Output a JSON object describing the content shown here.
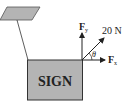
{
  "diagram": {
    "sign_label": "SIGN",
    "force_label": "20 N",
    "fy_label": "F",
    "fy_sub": "y",
    "fx_label": "F",
    "fx_sub": "x",
    "angle_label": "θ",
    "colors": {
      "sign_fill": "#b4b4b4",
      "mount_fill": "#b4b4b4",
      "stroke": "#333333",
      "background": "#ffffff"
    }
  }
}
